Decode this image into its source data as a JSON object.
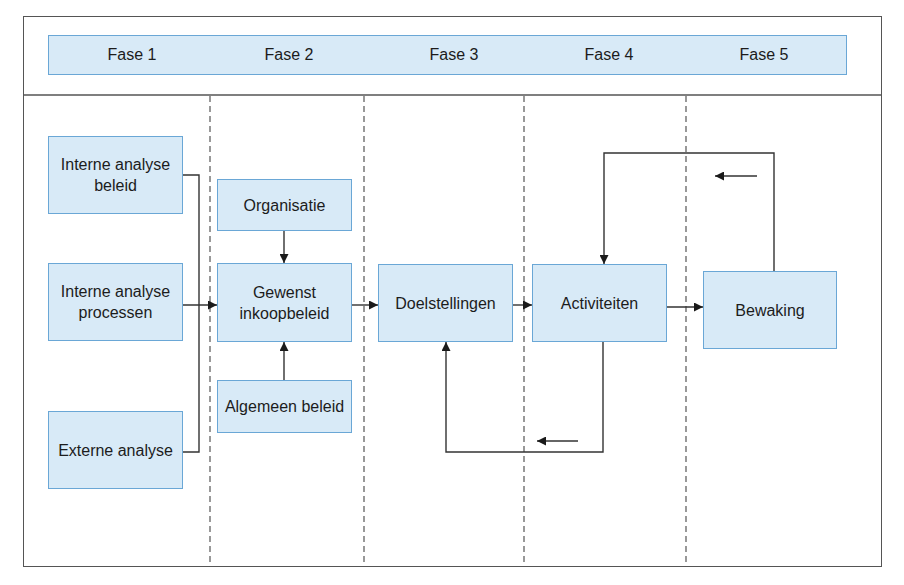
{
  "colors": {
    "box_fill": "#d8eaf7",
    "box_border": "#6aa7d6",
    "line": "#333333"
  },
  "phases": [
    {
      "label": "Fase 1"
    },
    {
      "label": "Fase 2"
    },
    {
      "label": "Fase 3"
    },
    {
      "label": "Fase 4"
    },
    {
      "label": "Fase 5"
    }
  ],
  "nodes": {
    "interne_analyse_beleid": {
      "label": "Interne analyse beleid",
      "phase": "Fase 1"
    },
    "interne_analyse_processen": {
      "label": "Interne analyse processen",
      "phase": "Fase 1"
    },
    "externe_analyse": {
      "label": "Externe analyse",
      "phase": "Fase 1"
    },
    "organisatie": {
      "label": "Organisatie",
      "phase": "Fase 2"
    },
    "gewenst_inkoopbeleid": {
      "label": "Gewenst inkoopbeleid",
      "phase": "Fase 2"
    },
    "algemeen_beleid": {
      "label": "Algemeen beleid",
      "phase": "Fase 2"
    },
    "doelstellingen": {
      "label": "Doelstellingen",
      "phase": "Fase 3"
    },
    "activiteiten": {
      "label": "Activiteiten",
      "phase": "Fase 4"
    },
    "bewaking": {
      "label": "Bewaking",
      "phase": "Fase 5"
    }
  },
  "edges": [
    {
      "from": "interne_analyse_beleid",
      "to": "gewenst_inkoopbeleid"
    },
    {
      "from": "interne_analyse_processen",
      "to": "gewenst_inkoopbeleid"
    },
    {
      "from": "externe_analyse",
      "to": "gewenst_inkoopbeleid"
    },
    {
      "from": "organisatie",
      "to": "gewenst_inkoopbeleid"
    },
    {
      "from": "algemeen_beleid",
      "to": "gewenst_inkoopbeleid"
    },
    {
      "from": "gewenst_inkoopbeleid",
      "to": "doelstellingen"
    },
    {
      "from": "doelstellingen",
      "to": "activiteiten"
    },
    {
      "from": "activiteiten",
      "to": "bewaking"
    },
    {
      "from": "bewaking",
      "to": "activiteiten",
      "type": "feedback"
    },
    {
      "from": "activiteiten",
      "to": "doelstellingen",
      "type": "feedback"
    }
  ]
}
